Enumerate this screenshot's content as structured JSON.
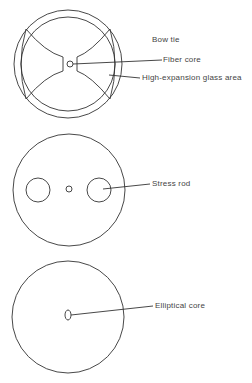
{
  "diagrams": [
    {
      "title": "Bow tie",
      "labels": [
        "Fiber core",
        "High-expansion glass area"
      ]
    },
    {
      "labels": [
        "Stress rod"
      ]
    },
    {
      "labels": [
        "Elliptical core"
      ]
    }
  ],
  "colors": {
    "line": "#333333",
    "background": "#ffffff"
  }
}
